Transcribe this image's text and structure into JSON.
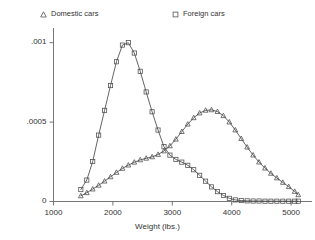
{
  "chart_data": {
    "type": "line",
    "title": "",
    "subtitle": "",
    "xlabel": "Weight (lbs.)",
    "ylabel": "",
    "xlim": [
      1000,
      5200
    ],
    "ylim": [
      0,
      0.00108
    ],
    "grid": false,
    "legend_position": "top",
    "xticks": [
      1000,
      2000,
      3000,
      4000,
      5000
    ],
    "xtick_labels": [
      "1000",
      "2000",
      "3000",
      "4000",
      "5000"
    ],
    "yticks": [
      0,
      0.0005,
      0.001
    ],
    "ytick_labels": [
      "0",
      ".0005",
      ".001"
    ],
    "annotations": [],
    "series": [
      {
        "name": "Domestic cars",
        "marker": "triangle",
        "color": "#4a4a4a",
        "x": [
          1460,
          1560,
          1660,
          1760,
          1860,
          1960,
          2060,
          2160,
          2260,
          2360,
          2460,
          2560,
          2660,
          2760,
          2860,
          2960,
          3060,
          3160,
          3260,
          3360,
          3460,
          3560,
          3660,
          3760,
          3860,
          3960,
          4060,
          4160,
          4260,
          4360,
          4460,
          4560,
          4660,
          4760,
          4860,
          4960,
          5060,
          5120
        ],
        "values": [
          3.5e-05,
          5.5e-05,
          7.8e-05,
          0.000102,
          0.000128,
          0.000155,
          0.000183,
          0.000208,
          0.000229,
          0.000247,
          0.000262,
          0.000272,
          0.000281,
          0.000296,
          0.000318,
          0.00035,
          0.000392,
          0.00044,
          0.000487,
          0.000527,
          0.000557,
          0.000574,
          0.000577,
          0.000566,
          0.00054,
          0.0005,
          0.00045,
          0.000396,
          0.000342,
          0.000292,
          0.000248,
          0.00021,
          0.000177,
          0.000148,
          0.00012,
          9.3e-05,
          6.3e-05,
          4.2e-05
        ]
      },
      {
        "name": "Foreign cars",
        "marker": "square",
        "color": "#4a4a4a",
        "x": [
          1460,
          1560,
          1660,
          1760,
          1860,
          1960,
          2060,
          2160,
          2260,
          2360,
          2460,
          2560,
          2660,
          2760,
          2860,
          2960,
          3060,
          3160,
          3260,
          3360,
          3460,
          3560,
          3660,
          3760,
          3860,
          3960,
          4060,
          4160,
          4260,
          4360,
          4460,
          4560,
          4660,
          4760,
          4860,
          4960,
          5060,
          5120
        ],
        "values": [
          7.5e-05,
          0.000135,
          0.000252,
          0.000418,
          0.000574,
          0.00073,
          0.00088,
          0.000985,
          0.001,
          0.000935,
          0.00082,
          0.00069,
          0.000565,
          0.00045,
          0.000345,
          0.000292,
          0.000265,
          0.000248,
          0.000228,
          0.0002,
          0.000165,
          0.000128,
          9.2e-05,
          6.2e-05,
          3.8e-05,
          2e-05,
          1e-05,
          6e-06,
          4e-06,
          3e-06,
          3e-06,
          2e-06,
          2e-06,
          2e-06,
          2e-06,
          2e-06,
          2e-06,
          2e-06
        ]
      }
    ]
  },
  "legend": {
    "entries": [
      {
        "label": "Domestic cars",
        "marker": "triangle-marker-icon"
      },
      {
        "label": "Foreign cars",
        "marker": "square-marker-icon"
      }
    ]
  },
  "axes": {
    "x_title": "Weight (lbs.)",
    "x_tick_labels": [
      "1000",
      "2000",
      "3000",
      "4000",
      "5000"
    ],
    "y_tick_labels": [
      ".001",
      ".0005",
      "0"
    ]
  },
  "colors": {
    "axis": "#666666",
    "line": "#4a4a4a",
    "text": "#333333",
    "background": "#ffffff"
  }
}
